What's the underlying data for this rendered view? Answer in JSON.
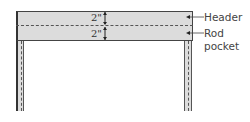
{
  "diagram": {
    "dimensions": [
      {
        "label": "2\"",
        "section": "header"
      },
      {
        "label": "2\"",
        "section": "rod_pocket"
      }
    ],
    "callouts": {
      "header": "Header",
      "rod_pocket_line1": "Rod",
      "rod_pocket_line2": "pocket"
    },
    "colors": {
      "fabric": "#dcdcdc",
      "outline": "#444444",
      "text": "#444444"
    }
  }
}
